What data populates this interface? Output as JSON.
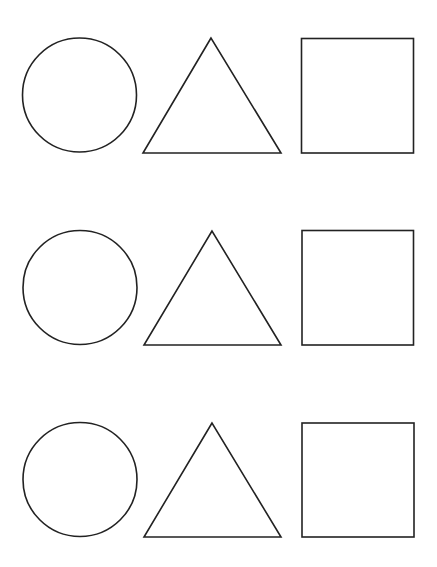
{
  "worksheet": {
    "background": "#ffffff",
    "stroke_color": "#222222",
    "rows": [
      {
        "circle": {
          "cx": 79.5,
          "cy": 95,
          "r": 57
        },
        "triangle": {
          "points": "211,38 143,153 281,153"
        },
        "square": {
          "x": 301.5,
          "y": 38.5,
          "w": 112,
          "h": 114.5
        }
      },
      {
        "circle": {
          "cx": 80,
          "cy": 287.5,
          "r": 57
        },
        "triangle": {
          "points": "212,231 144,345 281,345"
        },
        "square": {
          "x": 302,
          "y": 230.5,
          "w": 111.5,
          "h": 114.5
        }
      },
      {
        "circle": {
          "cx": 80,
          "cy": 479.5,
          "r": 57
        },
        "triangle": {
          "points": "212,423 144,537 281,537"
        },
        "square": {
          "x": 302,
          "y": 423,
          "w": 112,
          "h": 114
        }
      }
    ],
    "shape_order": [
      "circle",
      "triangle",
      "square"
    ]
  }
}
